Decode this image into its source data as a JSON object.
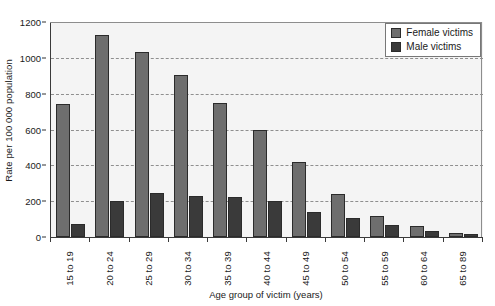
{
  "chart_data": {
    "type": "bar",
    "title": "",
    "subtitle": "",
    "xlabel": "Age group of victim (years)",
    "ylabel": "Rate per 100 000 population",
    "categories": [
      "15 to 19",
      "20 to 24",
      "25 to 29",
      "30 to 34",
      "35 to 39",
      "40 to 44",
      "45 to 49",
      "50 to 54",
      "55 to 59",
      "60 to 64",
      "65 to 89"
    ],
    "series": [
      {
        "name": "Female victims",
        "color": "#6e6e6e",
        "values": [
          745,
          1130,
          1035,
          905,
          750,
          600,
          420,
          240,
          115,
          60,
          22
        ]
      },
      {
        "name": "Male victims",
        "color": "#3a3a3a",
        "values": [
          75,
          200,
          245,
          230,
          225,
          200,
          140,
          105,
          65,
          35,
          15
        ]
      }
    ],
    "ylim": [
      0,
      1200
    ],
    "yticks": [
      0,
      200,
      400,
      600,
      800,
      1000,
      1200
    ],
    "ytick_labels": [
      "0",
      "200",
      "400",
      "600",
      "800",
      "1000",
      "1200"
    ],
    "grid": true,
    "grid_axis": "y",
    "grid_style": "dashed",
    "legend_position": "top-right",
    "plot_background": "#f4f4f4",
    "annotations": []
  },
  "legend": {
    "entries": [
      {
        "label": "Female victims",
        "swatch": "female-swatch"
      },
      {
        "label": "Male victims",
        "swatch": "male-swatch"
      }
    ]
  }
}
